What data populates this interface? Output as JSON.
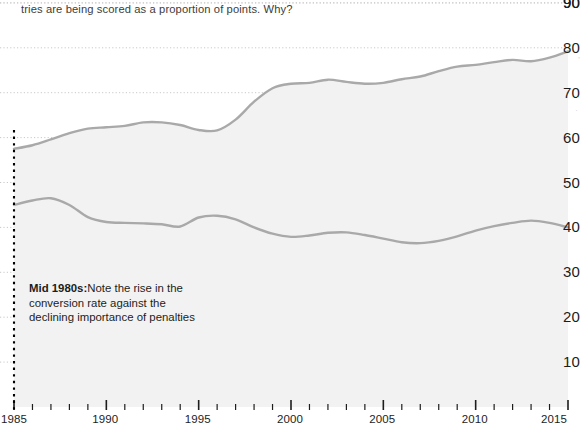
{
  "caption": {
    "text": "tries are being scored as a proportion of points. Why?"
  },
  "annotation": {
    "lead": "Mid 1980s:",
    "body": "Note the rise in the conversion rate against the declining importance of penalties",
    "marker_year": 1985
  },
  "colors": {
    "line": "#a9a9a9",
    "fill": "#f2f2f2",
    "gridline": "#c9c9c9",
    "marker_line": "#000000",
    "text": "#1d1d1b",
    "caption_text": "#3c3c3b"
  },
  "chart_data": {
    "type": "area",
    "title": "",
    "subtitle": "",
    "xlabel": "",
    "ylabel": "",
    "xlim": [
      1985,
      2015
    ],
    "ylim": [
      0,
      90
    ],
    "grid": true,
    "legend_position": "none",
    "y_ticks": [
      10,
      20,
      30,
      40,
      50,
      60,
      70,
      80,
      90
    ],
    "x_ticks": [
      1985,
      1990,
      1995,
      2000,
      2005,
      2010,
      2015
    ],
    "x_minor_tick_step": 1,
    "x": [
      1985,
      1986,
      1987,
      1988,
      1989,
      1990,
      1991,
      1992,
      1993,
      1994,
      1995,
      1996,
      1997,
      1998,
      1999,
      2000,
      2001,
      2002,
      2003,
      2004,
      2005,
      2006,
      2007,
      2008,
      2009,
      2010,
      2011,
      2012,
      2013,
      2014,
      2015
    ],
    "series": [
      {
        "name": "Conversion rate",
        "values": [
          57.5,
          58.3,
          59.6,
          61.0,
          62.0,
          62.3,
          62.6,
          63.4,
          63.4,
          62.8,
          61.7,
          61.6,
          64.0,
          68.0,
          71.0,
          72.0,
          72.2,
          72.9,
          72.4,
          72.0,
          72.2,
          73.0,
          73.6,
          74.8,
          75.8,
          76.2,
          76.8,
          77.3,
          77.0,
          77.8,
          79.2
        ]
      },
      {
        "name": "Penalties share of points",
        "values": [
          45.0,
          46.0,
          46.5,
          45.0,
          42.3,
          41.2,
          41.0,
          40.9,
          40.7,
          40.2,
          42.2,
          42.6,
          41.8,
          40.0,
          38.6,
          37.9,
          38.2,
          38.8,
          38.9,
          38.3,
          37.5,
          36.7,
          36.5,
          37.0,
          38.0,
          39.3,
          40.3,
          41.0,
          41.5,
          41.0,
          40.0
        ]
      }
    ]
  },
  "edge_artifacts": [
    {
      "glyph": "’",
      "x": 578,
      "y": 56
    },
    {
      "glyph": "·",
      "x": 576,
      "y": 93
    },
    {
      "glyph": "·",
      "x": 575,
      "y": 106
    }
  ]
}
